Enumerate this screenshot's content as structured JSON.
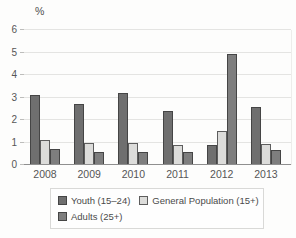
{
  "chart": {
    "ylabel": "%"
  },
  "chart_data": {
    "type": "bar",
    "categories": [
      "2008",
      "2009",
      "2010",
      "2011",
      "2012",
      "2013"
    ],
    "series": [
      {
        "name": "Youth (15–24)",
        "color": "#6f6f6f",
        "border_color": "#454545",
        "values": [
          3.1,
          2.7,
          3.2,
          2.4,
          0.9,
          2.6
        ]
      },
      {
        "name": "General Population (15+)",
        "color": "#dcdcda",
        "border_color": "#5d5d5d",
        "values": [
          1.1,
          1.0,
          1.0,
          0.9,
          1.5,
          0.95
        ]
      },
      {
        "name": "Adults (25+)",
        "color": "#7e7e7e",
        "border_color": "#454545",
        "values": [
          0.7,
          0.6,
          0.6,
          0.6,
          4.95,
          0.65
        ]
      }
    ],
    "title": "",
    "xlabel": "",
    "ylabel": "%",
    "ylim": [
      0,
      6
    ],
    "yticks": [
      0,
      1,
      2,
      3,
      4,
      5,
      6
    ],
    "grid": true,
    "legend_position": "bottom",
    "legend_rows": [
      [
        0,
        1
      ],
      [
        2
      ]
    ]
  }
}
